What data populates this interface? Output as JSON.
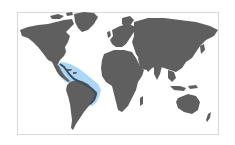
{
  "map": {
    "type": "world-range-map",
    "land_color": "#5f5f5f",
    "range_color": "#a8d4f5",
    "coast_highlight_color": "#3a4f63",
    "background_color": "#ffffff",
    "border_color": "#d9d9d9",
    "highlighted_region": "Gulf of Mexico, Caribbean Sea and Atlantic coast of northern South America to eastern Brazil"
  }
}
